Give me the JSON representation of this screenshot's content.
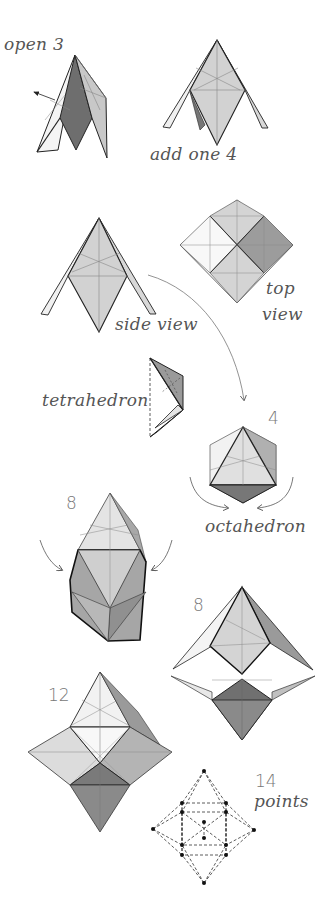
{
  "diagram": {
    "type": "origami-assembly-instructions",
    "colors": {
      "background": "#ffffff",
      "light_face": "#e8e8e8",
      "mid_face": "#c4c4c4",
      "dark_face": "#8a8a8a",
      "darkest_face": "#6e6e6e",
      "edge": "#222222",
      "crease": "#888888",
      "label_text": "#555555"
    },
    "steps": [
      {
        "id": "open-3",
        "label": "open 3"
      },
      {
        "id": "add-one-4",
        "label": "add one 4"
      },
      {
        "id": "side-view",
        "label": "side view"
      },
      {
        "id": "top-view",
        "label_line1": "top",
        "label_line2": "view"
      },
      {
        "id": "tetrahedron",
        "label": "tetrahedron"
      },
      {
        "id": "octahedron",
        "count": "4",
        "label": "octahedron"
      },
      {
        "id": "eight-a",
        "count": "8"
      },
      {
        "id": "eight-b",
        "count": "8"
      },
      {
        "id": "twelve",
        "count": "12"
      },
      {
        "id": "fourteen-points",
        "count": "14",
        "label": "points"
      }
    ]
  }
}
